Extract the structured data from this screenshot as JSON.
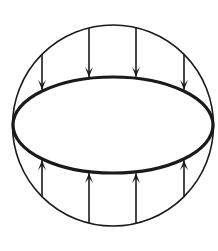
{
  "diagram": {
    "colors": {
      "stroke": "#1a1a1a",
      "background": "#ffffff"
    },
    "outer_circle": {
      "cx": 113,
      "cy": 125.5,
      "r": 100.5
    },
    "equator_ellipse": {
      "cx": 113,
      "cy": 125,
      "rx": 100,
      "ry": 48
    },
    "arrows": {
      "top_direction": "down",
      "bottom_direction": "up",
      "x_positions": [
        42,
        89,
        136,
        184
      ],
      "count_top": 4,
      "count_bottom": 4
    }
  }
}
